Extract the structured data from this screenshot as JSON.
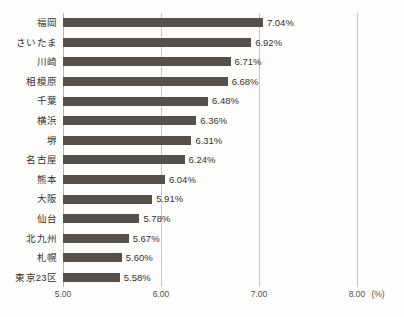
{
  "chart_data": {
    "type": "bar",
    "orientation": "horizontal",
    "title": "",
    "subtitle": "",
    "xlabel": "(%)",
    "ylabel": "",
    "unit": "(%)",
    "xlim": [
      5.0,
      8.0
    ],
    "xticks": [
      "5.00",
      "6.00",
      "7.00",
      "8.00"
    ],
    "xtick_values": [
      5.0,
      6.0,
      7.0,
      8.0
    ],
    "grid": "vertical",
    "legend": "none",
    "categories": [
      "福岡",
      "さいたま",
      "川崎",
      "相模原",
      "千葉",
      "横浜",
      "堺",
      "名古屋",
      "熊本",
      "大阪",
      "仙台",
      "北九州",
      "札幌",
      "東京23区"
    ],
    "values": [
      7.04,
      6.92,
      6.71,
      6.68,
      6.48,
      6.36,
      6.31,
      6.24,
      6.04,
      5.91,
      5.78,
      5.67,
      5.6,
      5.58
    ],
    "data_labels": [
      "7.04%",
      "6.92%",
      "6.71%",
      "6.68%",
      "6.48%",
      "6.36%",
      "6.31%",
      "6.24%",
      "6.04%",
      "5.91%",
      "5.78%",
      "5.67%",
      "5.60%",
      "5.58%"
    ],
    "bar_color": "#55504a",
    "grid_color": "#c9c7c3",
    "background_color": "#fdfdfc",
    "text_color": "#35322e"
  }
}
